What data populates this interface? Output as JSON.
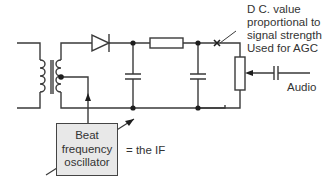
{
  "diagram": {
    "annotations": {
      "dc_value": [
        "D C. value",
        "proportional to",
        "signal strength",
        "Used for AGC"
      ],
      "audio": "Audio",
      "bfo_note": "= the IF"
    },
    "bfo_box": {
      "lines": [
        "Beat",
        "frequency",
        "oscillator"
      ]
    },
    "components": [
      {
        "id": "transformer",
        "type": "transformer",
        "note": "center-tapped secondary"
      },
      {
        "id": "diode",
        "type": "diode"
      },
      {
        "id": "cap1",
        "type": "capacitor"
      },
      {
        "id": "resistor",
        "type": "resistor"
      },
      {
        "id": "cap2",
        "type": "capacitor"
      },
      {
        "id": "potentiometer",
        "type": "variable-resistor"
      },
      {
        "id": "coupling-cap",
        "type": "capacitor"
      },
      {
        "id": "bfo",
        "type": "oscillator-block"
      }
    ],
    "colors": {
      "line": "#3a3a3a",
      "box_fill": "#e8e8e8",
      "text": "#333333"
    }
  }
}
